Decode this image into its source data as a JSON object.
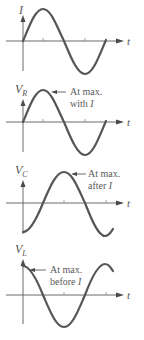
{
  "figure": {
    "panels": [
      {
        "id": "current",
        "y_label": "I",
        "y_label_sub": "",
        "x_label": "t",
        "annotation_line1": "",
        "annotation_line2": "",
        "phase": "reference"
      },
      {
        "id": "resistor-voltage",
        "y_label": "V",
        "y_label_sub": "R",
        "x_label": "t",
        "annotation_line1": "At max.",
        "annotation_line2": "with",
        "annotation_italic": "I",
        "phase": "in phase with I"
      },
      {
        "id": "capacitor-voltage",
        "y_label": "V",
        "y_label_sub": "C",
        "x_label": "t",
        "annotation_line1": "At max.",
        "annotation_line2": "after",
        "annotation_italic": "I",
        "phase": "lags I by 90°"
      },
      {
        "id": "inductor-voltage",
        "y_label": "V",
        "y_label_sub": "L",
        "x_label": "t",
        "annotation_line1": "At max.",
        "annotation_line2": "before",
        "annotation_italic": "I",
        "phase": "leads I by 90°"
      }
    ]
  },
  "colors": {
    "wave": "#555555",
    "axis": "#6a6a6a",
    "text": "#555555"
  }
}
